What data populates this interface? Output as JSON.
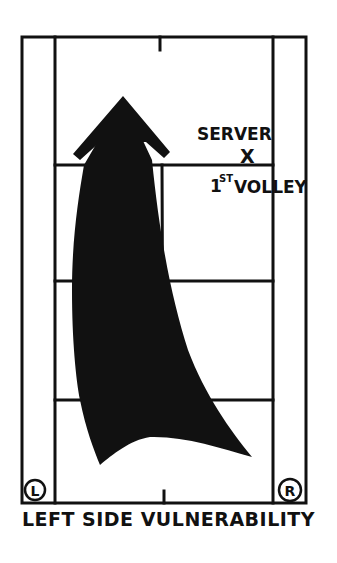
{
  "diagram": {
    "caption": "LEFT SIDE VULNERABILITY",
    "labels": {
      "server": "SERVER",
      "server_marker": "X",
      "first_volley_number": "1",
      "first_volley_suffix": "ST",
      "first_volley_word": "VOLLEY"
    },
    "corner_markers": {
      "left": "L",
      "right": "R"
    },
    "elements": {
      "court": "tennis-court-half-outline",
      "arrow": "vulnerability-arrow-pointing-up"
    },
    "colors": {
      "ink": "#111111",
      "background": "#ffffff"
    }
  }
}
